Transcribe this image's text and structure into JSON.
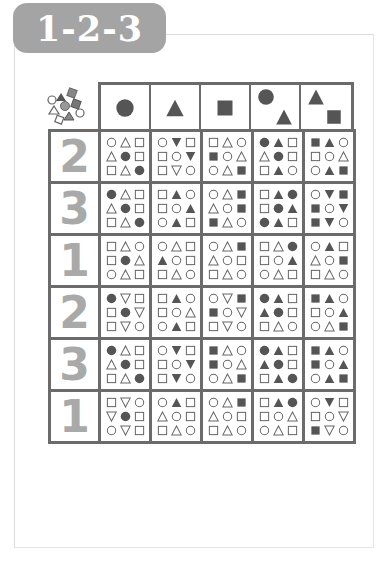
{
  "title": "1-2-3",
  "colors": {
    "shape_fill": "#555555",
    "shape_outline": "#666666",
    "grid_line": "#6b6b6b",
    "number": "#a9a9a9",
    "title_bg": "#a4a4a4"
  },
  "legend": "shape types: circle, triangle, square, inverted triangle; filled or outlined",
  "column_headers": [
    {
      "shapes": [
        "circle"
      ]
    },
    {
      "shapes": [
        "triangle"
      ]
    },
    {
      "shapes": [
        "square"
      ]
    },
    {
      "shapes": [
        "circle",
        "triangle"
      ]
    },
    {
      "shapes": [
        "triangle",
        "square"
      ]
    }
  ],
  "rows": [
    {
      "number": "2",
      "cells": [
        [
          "o-circle",
          "o-triangle",
          "o-square",
          "o-triangle",
          "f-circle",
          "o-square",
          "o-square",
          "o-triangle",
          "f-circle"
        ],
        [
          "o-circle",
          "f-invtri",
          "o-square",
          "o-square",
          "o-circle",
          "f-invtri",
          "o-square",
          "o-invtri",
          "o-circle"
        ],
        [
          "o-square",
          "o-triangle",
          "o-circle",
          "f-square",
          "o-circle",
          "o-triangle",
          "o-circle",
          "o-triangle",
          "f-square"
        ],
        [
          "f-circle",
          "f-triangle",
          "o-square",
          "o-triangle",
          "f-circle",
          "o-square",
          "o-square",
          "f-triangle",
          "o-circle"
        ],
        [
          "f-square",
          "f-triangle",
          "o-circle",
          "o-square",
          "o-circle",
          "o-triangle",
          "o-circle",
          "f-triangle",
          "f-square"
        ]
      ]
    },
    {
      "number": "3",
      "cells": [
        [
          "f-circle",
          "o-triangle",
          "o-square",
          "o-triangle",
          "f-circle",
          "o-square",
          "o-square",
          "o-triangle",
          "f-circle"
        ],
        [
          "o-square",
          "f-triangle",
          "o-circle",
          "o-square",
          "o-circle",
          "f-triangle",
          "o-circle",
          "f-triangle",
          "o-square"
        ],
        [
          "o-circle",
          "o-triangle",
          "f-square",
          "o-triangle",
          "o-circle",
          "f-square",
          "f-square",
          "o-triangle",
          "o-circle"
        ],
        [
          "o-square",
          "f-triangle",
          "f-circle",
          "o-square",
          "f-circle",
          "f-triangle",
          "f-circle",
          "f-triangle",
          "o-square"
        ],
        [
          "o-circle",
          "f-invtri",
          "f-square",
          "f-square",
          "o-circle",
          "f-invtri",
          "f-square",
          "f-invtri",
          "o-circle"
        ]
      ]
    },
    {
      "number": "1",
      "cells": [
        [
          "o-square",
          "o-triangle",
          "o-circle",
          "o-square",
          "f-circle",
          "o-triangle",
          "o-circle",
          "o-triangle",
          "o-square"
        ],
        [
          "o-circle",
          "o-triangle",
          "o-square",
          "f-triangle",
          "o-circle",
          "o-square",
          "o-square",
          "o-triangle",
          "o-circle"
        ],
        [
          "o-circle",
          "o-triangle",
          "f-square",
          "o-triangle",
          "o-circle",
          "o-square",
          "o-square",
          "o-triangle",
          "o-circle"
        ],
        [
          "o-square",
          "o-triangle",
          "f-circle",
          "o-square",
          "o-circle",
          "f-triangle",
          "o-circle",
          "o-triangle",
          "o-square"
        ],
        [
          "o-circle",
          "f-triangle",
          "o-square",
          "o-triangle",
          "o-circle",
          "f-square",
          "o-square",
          "o-triangle",
          "o-circle"
        ]
      ]
    },
    {
      "number": "2",
      "cells": [
        [
          "f-circle",
          "o-invtri",
          "o-square",
          "o-square",
          "f-circle",
          "o-invtri",
          "o-square",
          "o-invtri",
          "o-circle"
        ],
        [
          "o-square",
          "f-triangle",
          "o-circle",
          "o-square",
          "o-circle",
          "o-triangle",
          "o-circle",
          "f-triangle",
          "o-square"
        ],
        [
          "o-circle",
          "o-invtri",
          "f-square",
          "f-square",
          "o-circle",
          "o-invtri",
          "o-square",
          "o-invtri",
          "o-circle"
        ],
        [
          "f-circle",
          "f-triangle",
          "o-square",
          "f-triangle",
          "f-circle",
          "o-square",
          "o-square",
          "o-triangle",
          "o-circle"
        ],
        [
          "f-square",
          "f-triangle",
          "o-circle",
          "o-square",
          "o-circle",
          "f-triangle",
          "o-circle",
          "o-triangle",
          "f-square"
        ]
      ]
    },
    {
      "number": "3",
      "cells": [
        [
          "f-circle",
          "o-triangle",
          "o-square",
          "o-triangle",
          "f-circle",
          "o-square",
          "o-square",
          "o-triangle",
          "f-circle"
        ],
        [
          "o-circle",
          "f-invtri",
          "o-square",
          "o-square",
          "o-circle",
          "f-invtri",
          "o-square",
          "f-invtri",
          "o-circle"
        ],
        [
          "f-square",
          "o-triangle",
          "o-circle",
          "f-square",
          "o-circle",
          "o-triangle",
          "o-circle",
          "o-triangle",
          "f-square"
        ],
        [
          "f-circle",
          "f-triangle",
          "o-square",
          "f-triangle",
          "f-circle",
          "o-square",
          "o-square",
          "f-triangle",
          "f-circle"
        ],
        [
          "f-square",
          "f-triangle",
          "o-circle",
          "f-square",
          "o-circle",
          "f-triangle",
          "o-circle",
          "f-triangle",
          "f-square"
        ]
      ]
    },
    {
      "number": "1",
      "cells": [
        [
          "o-square",
          "o-invtri",
          "o-circle",
          "o-invtri",
          "f-circle",
          "o-square",
          "o-circle",
          "o-invtri",
          "o-square"
        ],
        [
          "o-circle",
          "f-triangle",
          "o-square",
          "o-triangle",
          "o-circle",
          "o-square",
          "o-square",
          "o-triangle",
          "o-circle"
        ],
        [
          "o-circle",
          "o-triangle",
          "f-square",
          "o-triangle",
          "o-circle",
          "o-square",
          "o-square",
          "o-triangle",
          "o-circle"
        ],
        [
          "o-square",
          "f-triangle",
          "f-circle",
          "o-square",
          "o-circle",
          "o-triangle",
          "o-circle",
          "o-triangle",
          "o-square"
        ],
        [
          "o-circle",
          "f-invtri",
          "o-square",
          "o-square",
          "o-circle",
          "o-invtri",
          "f-square",
          "o-invtri",
          "o-circle"
        ]
      ]
    }
  ]
}
